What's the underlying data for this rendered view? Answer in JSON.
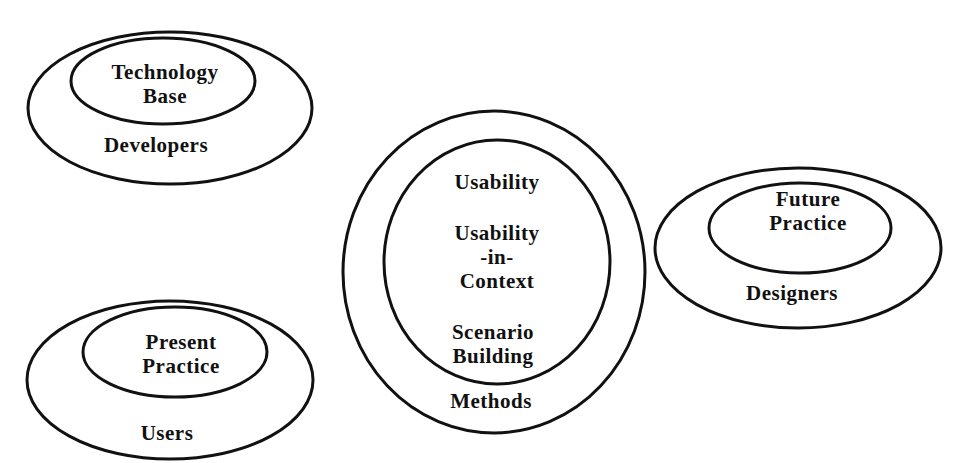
{
  "diagram": {
    "groups": [
      {
        "id": "developers",
        "outer_label": "Developers",
        "inner_label_lines": [
          "Technology",
          "Base"
        ]
      },
      {
        "id": "methods",
        "outer_label": "Methods",
        "inner_label_items": [
          "Usability",
          "Usability",
          "-in-",
          "Context",
          "Scenario",
          "Building"
        ]
      },
      {
        "id": "designers",
        "outer_label": "Designers",
        "inner_label_lines": [
          "Future",
          "Practice"
        ]
      },
      {
        "id": "users",
        "outer_label": "Users",
        "inner_label_lines": [
          "Present",
          "Practice"
        ]
      }
    ],
    "stroke_color": "#111111",
    "background": "#ffffff"
  }
}
